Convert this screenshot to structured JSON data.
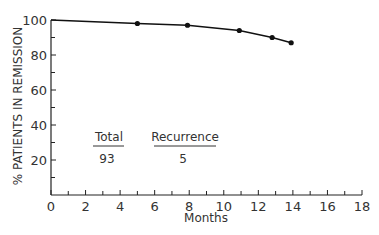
{
  "chart_data": {
    "type": "line",
    "title": "",
    "xlabel": "Months",
    "ylabel": "% PATIENTS IN REMISSION",
    "xlim": [
      0,
      18
    ],
    "ylim": [
      0,
      100
    ],
    "x_ticks": [
      0,
      2,
      4,
      6,
      8,
      10,
      12,
      14,
      16,
      18
    ],
    "x_minor_ticks": [
      1,
      3,
      5,
      7,
      9,
      11,
      13,
      15,
      17
    ],
    "y_ticks": [
      20,
      40,
      60,
      80,
      100
    ],
    "y_minor_ticks": [
      10,
      30,
      50,
      70,
      90
    ],
    "grid": false,
    "legend": null,
    "series": [
      {
        "name": "Remission",
        "x": [
          0,
          5,
          7.9,
          10.9,
          12.8,
          13.9
        ],
        "y": [
          100,
          98,
          97,
          94,
          90,
          87
        ],
        "markers": [
          false,
          true,
          true,
          true,
          true,
          true
        ]
      }
    ],
    "annotations": {
      "total_label": "Total",
      "total_value": "93",
      "recurrence_label": "Recurrence",
      "recurrence_value": "5"
    }
  },
  "colors": {
    "line": "#111111",
    "axis": "#222222",
    "text": "#333333"
  }
}
